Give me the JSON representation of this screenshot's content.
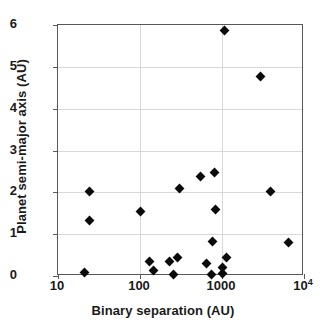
{
  "chart_data": {
    "type": "scatter",
    "title": "",
    "xlabel": "Binary  separation  (AU)",
    "ylabel": "Planet  semi-major  axis  (AU)",
    "xscale": "log",
    "yscale": "linear",
    "xlim": [
      10,
      10000
    ],
    "ylim": [
      0,
      6
    ],
    "grid": true,
    "legend": null,
    "marker": "filled-diamond",
    "marker_color": "#0b0b0b",
    "x_ticks": [
      {
        "value": 10,
        "label": "10",
        "exponent": ""
      },
      {
        "value": 100,
        "label": "100",
        "exponent": ""
      },
      {
        "value": 1000,
        "label": "1000",
        "exponent": ""
      },
      {
        "value": 10000,
        "label": "10",
        "exponent": "4"
      }
    ],
    "y_ticks": [
      {
        "value": 0,
        "label": "0"
      },
      {
        "value": 1,
        "label": "1"
      },
      {
        "value": 2,
        "label": "2"
      },
      {
        "value": 3,
        "label": "3"
      },
      {
        "value": 4,
        "label": "4"
      },
      {
        "value": 5,
        "label": "5"
      },
      {
        "value": 6,
        "label": "6"
      }
    ],
    "points": [
      {
        "x": 21,
        "y": 0.08
      },
      {
        "x": 24,
        "y": 1.32
      },
      {
        "x": 24,
        "y": 2.02
      },
      {
        "x": 100,
        "y": 1.53
      },
      {
        "x": 130,
        "y": 0.34
      },
      {
        "x": 148,
        "y": 0.13
      },
      {
        "x": 230,
        "y": 0.34
      },
      {
        "x": 258,
        "y": 0.04
      },
      {
        "x": 285,
        "y": 0.44
      },
      {
        "x": 305,
        "y": 2.08
      },
      {
        "x": 540,
        "y": 2.37
      },
      {
        "x": 640,
        "y": 0.31
      },
      {
        "x": 740,
        "y": 0.04
      },
      {
        "x": 770,
        "y": 0.82
      },
      {
        "x": 800,
        "y": 2.47
      },
      {
        "x": 830,
        "y": 1.59
      },
      {
        "x": 1000,
        "y": 0.07
      },
      {
        "x": 1010,
        "y": 0.2
      },
      {
        "x": 1060,
        "y": 5.87
      },
      {
        "x": 1150,
        "y": 0.45
      },
      {
        "x": 2950,
        "y": 4.78
      },
      {
        "x": 3900,
        "y": 2.01
      },
      {
        "x": 6400,
        "y": 0.79
      }
    ]
  }
}
